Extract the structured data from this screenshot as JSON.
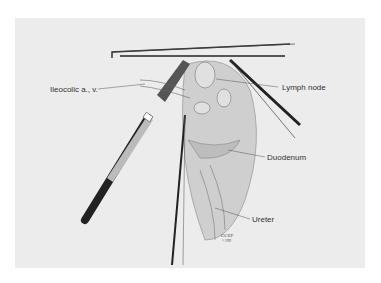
{
  "labels": {
    "ileocolic": "Ileocolic a., v.",
    "lymph_node": "Lymph node",
    "duodenum": "Duodenum",
    "ureter": "Ureter"
  },
  "signature": {
    "mark": "CCEF",
    "sub": "© 1999"
  }
}
